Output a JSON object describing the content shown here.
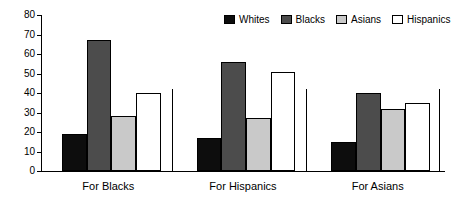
{
  "chart_data": {
    "type": "bar",
    "title": "",
    "subtitle": "",
    "xlabel": "",
    "ylabel": "",
    "ylim": [
      0,
      80
    ],
    "yticks": [
      0,
      10,
      20,
      30,
      40,
      50,
      60,
      70,
      80
    ],
    "ytick_labels": [
      "0",
      "10",
      "20",
      "30",
      "40",
      "50",
      "60",
      "70",
      "80"
    ],
    "grid": false,
    "legend_position": "top-right",
    "categories": [
      "For Blacks",
      "For Hispanics",
      "For Asians"
    ],
    "series": [
      {
        "name": "Whites",
        "color": "#0d0d0d",
        "values": [
          19,
          17,
          15
        ]
      },
      {
        "name": "Blacks",
        "color": "#4c4c4c",
        "values": [
          67,
          56,
          40
        ]
      },
      {
        "name": "Asians",
        "color": "#c9c9c9",
        "values": [
          28,
          27,
          32
        ]
      },
      {
        "name": "Hispanics",
        "color": "#ffffff",
        "values": [
          40,
          51,
          35
        ]
      }
    ]
  },
  "legend": {
    "items": [
      {
        "label": "Whites",
        "color": "#0d0d0d"
      },
      {
        "label": "Blacks",
        "color": "#4c4c4c"
      },
      {
        "label": "Asians",
        "color": "#c9c9c9"
      },
      {
        "label": "Hispanics",
        "color": "#ffffff"
      }
    ]
  },
  "axes": {
    "y_tick_labels": [
      "80",
      "70",
      "60",
      "50",
      "40",
      "30",
      "20",
      "10",
      "0"
    ],
    "x_category_labels": [
      "For Blacks",
      "For Hispanics",
      "For Asians"
    ]
  }
}
